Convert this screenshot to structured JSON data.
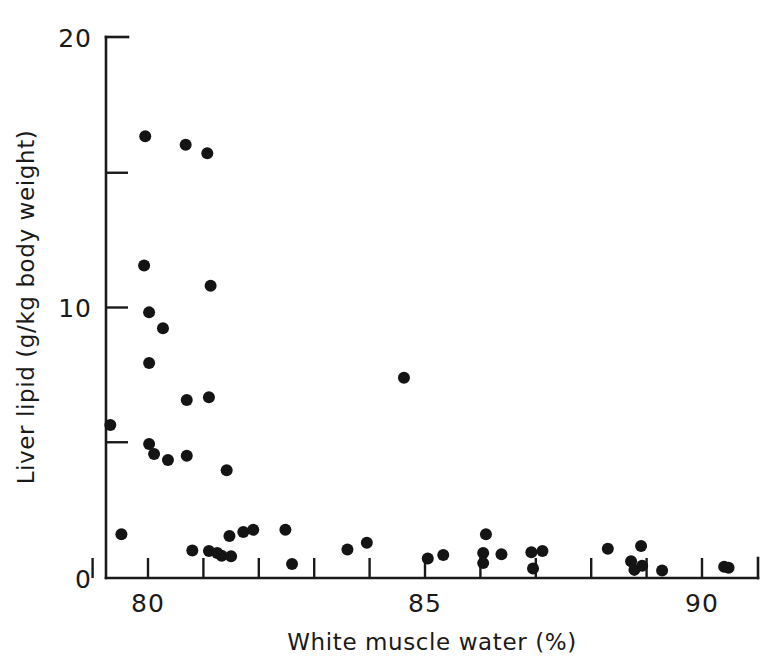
{
  "figure": {
    "name": "liver-lipid-vs-white-muscle-water-scatter",
    "background_color": "#ffffff",
    "marker_color": "#141414",
    "axis_color": "#1a1a1a"
  },
  "chart_data": {
    "type": "scatter",
    "title": "",
    "xlabel": "White muscle water (%)",
    "ylabel": "Liver lipid (g/kg body weight)",
    "xlim": [
      79.0,
      90.9
    ],
    "ylim": [
      0,
      20
    ],
    "xticks": [
      80,
      85,
      90
    ],
    "xtick_labels": [
      "80",
      "85",
      "90"
    ],
    "x_minor_ticks": [
      79,
      81,
      82,
      83,
      84,
      86,
      87,
      88,
      89
    ],
    "yticks": [
      0,
      5,
      10,
      15,
      20
    ],
    "ytick_labels": [
      "0",
      "",
      "",
      "",
      "20"
    ],
    "ytick_labels_shown": [
      "0",
      "10",
      "20"
    ],
    "grid": false,
    "legend": null,
    "marker": "filled-circle",
    "marker_size": 11,
    "points": [
      {
        "x": 79.32,
        "y": 5.66
      },
      {
        "x": 79.52,
        "y": 1.62
      },
      {
        "x": 79.95,
        "y": 16.33
      },
      {
        "x": 79.93,
        "y": 11.55
      },
      {
        "x": 80.02,
        "y": 9.82
      },
      {
        "x": 80.02,
        "y": 7.95
      },
      {
        "x": 80.02,
        "y": 4.95
      },
      {
        "x": 80.11,
        "y": 4.58
      },
      {
        "x": 80.27,
        "y": 9.23
      },
      {
        "x": 80.36,
        "y": 4.36
      },
      {
        "x": 80.68,
        "y": 16.02
      },
      {
        "x": 80.7,
        "y": 6.58
      },
      {
        "x": 80.7,
        "y": 4.52
      },
      {
        "x": 80.8,
        "y": 1.02
      },
      {
        "x": 81.07,
        "y": 15.7
      },
      {
        "x": 81.13,
        "y": 10.8
      },
      {
        "x": 81.1,
        "y": 6.68
      },
      {
        "x": 81.1,
        "y": 1.0
      },
      {
        "x": 81.25,
        "y": 0.92
      },
      {
        "x": 81.33,
        "y": 0.82
      },
      {
        "x": 81.42,
        "y": 3.98
      },
      {
        "x": 81.47,
        "y": 1.55
      },
      {
        "x": 81.5,
        "y": 0.8
      },
      {
        "x": 81.72,
        "y": 1.7
      },
      {
        "x": 81.9,
        "y": 1.78
      },
      {
        "x": 82.48,
        "y": 1.78
      },
      {
        "x": 82.6,
        "y": 0.52
      },
      {
        "x": 83.6,
        "y": 1.05
      },
      {
        "x": 83.95,
        "y": 1.3
      },
      {
        "x": 84.62,
        "y": 7.4
      },
      {
        "x": 85.05,
        "y": 0.72
      },
      {
        "x": 85.33,
        "y": 0.85
      },
      {
        "x": 86.1,
        "y": 1.62
      },
      {
        "x": 86.05,
        "y": 0.92
      },
      {
        "x": 86.05,
        "y": 0.55
      },
      {
        "x": 86.38,
        "y": 0.88
      },
      {
        "x": 86.92,
        "y": 0.95
      },
      {
        "x": 86.95,
        "y": 0.35
      },
      {
        "x": 87.12,
        "y": 1.0
      },
      {
        "x": 88.3,
        "y": 1.08
      },
      {
        "x": 88.72,
        "y": 0.62
      },
      {
        "x": 88.78,
        "y": 0.3
      },
      {
        "x": 88.9,
        "y": 1.18
      },
      {
        "x": 88.92,
        "y": 0.45
      },
      {
        "x": 89.28,
        "y": 0.28
      },
      {
        "x": 90.4,
        "y": 0.42
      },
      {
        "x": 90.48,
        "y": 0.38
      }
    ]
  },
  "axes": {
    "x_title": "White muscle water (%)",
    "y_title": "Liver lipid (g/kg body weight)",
    "x_tick_80": "80",
    "x_tick_85": "85",
    "x_tick_90": "90",
    "y_tick_0": "0",
    "y_tick_10": "10",
    "y_tick_20": "20"
  }
}
